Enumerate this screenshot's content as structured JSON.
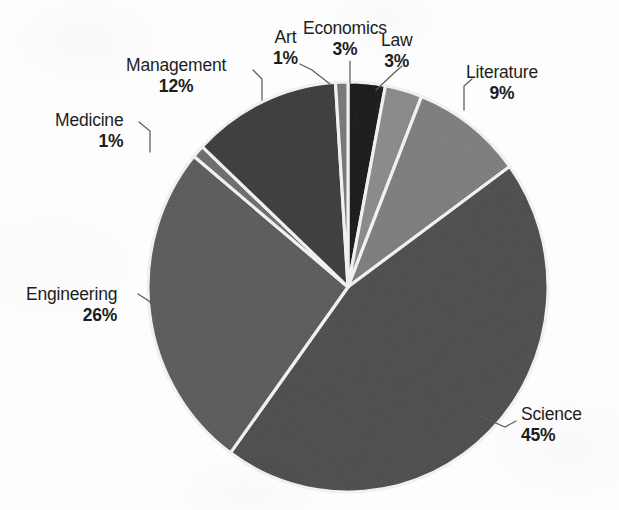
{
  "chart_data": {
    "type": "pie",
    "title": "",
    "subtitle": "",
    "xlabel": "",
    "ylabel": "",
    "legend_position": "none",
    "labels_position": "outside-with-leader-lines",
    "grid": false,
    "start_angle_deg": 0,
    "direction": "clockwise",
    "total_percent": 100,
    "categories": [
      "Economics",
      "Law",
      "Literature",
      "Science",
      "Engineering",
      "Medicine",
      "Management",
      "Art"
    ],
    "values": [
      3,
      3,
      9,
      45,
      26,
      1,
      12,
      1
    ],
    "value_suffix": "%",
    "slices": [
      {
        "name": "Economics",
        "value": 3,
        "percent_text": "3%",
        "color": "#565656",
        "label_x": 303,
        "label_y": 18,
        "align": "center",
        "leader": "M 350,61 L 350,83"
      },
      {
        "name": "Law",
        "value": 3,
        "percent_text": "3%",
        "color": "#bdbdbd",
        "label_x": 381,
        "label_y": 30,
        "align": "center",
        "leader": "M 402,66 L 393,74 L 376,90"
      },
      {
        "name": "Literature",
        "value": 9,
        "percent_text": "9%",
        "color": "#b4b4b4",
        "label_x": 466,
        "label_y": 62,
        "align": "center",
        "leader": "M 472,79 L 464,86 L 464,110"
      },
      {
        "name": "Science",
        "value": 45,
        "percent_text": "45%",
        "color": "#8e8e8e",
        "label_x": 521,
        "label_y": 404,
        "align": "left-al",
        "leader": "M 516,421 L 505,427 L 480,416"
      },
      {
        "name": "Engineering",
        "value": 26,
        "percent_text": "26%",
        "color": "#9a9a9a",
        "label_x": 26,
        "label_y": 284,
        "align": "right-al",
        "leader": "M 138,294 L 149,301 L 163,317"
      },
      {
        "name": "Medicine",
        "value": 1,
        "percent_text": "1%",
        "color": "#a8a8a8",
        "label_x": 55,
        "label_y": 110,
        "align": "right-al",
        "leader": "M 139,122 L 150,131 L 150,152"
      },
      {
        "name": "Management",
        "value": 12,
        "percent_text": "12%",
        "color": "#7e7e7e",
        "label_x": 126,
        "label_y": 55,
        "align": "center",
        "leader": "M 253,70 L 262,79 L 262,100"
      },
      {
        "name": "Art",
        "value": 1,
        "percent_text": "1%",
        "color": "#b0b0b0",
        "label_x": 273,
        "label_y": 27,
        "align": "center",
        "leader": "M 300,64 L 312,70 L 330,84"
      }
    ]
  },
  "colors": {
    "background": "#fdfdfd",
    "slice_separator": "#fbfbfb",
    "leader_line": "#5d5d5d",
    "label_text": "#1d1d1d"
  }
}
